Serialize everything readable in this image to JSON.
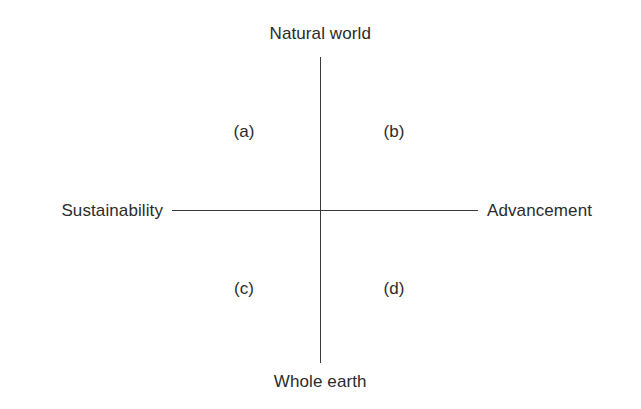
{
  "figure": {
    "type": "two-axis-quadrant-diagram",
    "background_color": "#ffffff",
    "line_color": "#3a3a3a",
    "text_color": "#2b2b2b"
  },
  "axes": {
    "vertical": {
      "top_label": "Natural world",
      "bottom_label": "Whole earth"
    },
    "horizontal": {
      "left_label": "Sustainability",
      "right_label": "Advancement"
    }
  },
  "quadrants": [
    {
      "id": "a",
      "label": "(a)",
      "position": "top-left"
    },
    {
      "id": "b",
      "label": "(b)",
      "position": "top-right"
    },
    {
      "id": "c",
      "label": "(c)",
      "position": "bottom-left"
    },
    {
      "id": "d",
      "label": "(d)",
      "position": "bottom-right"
    }
  ]
}
